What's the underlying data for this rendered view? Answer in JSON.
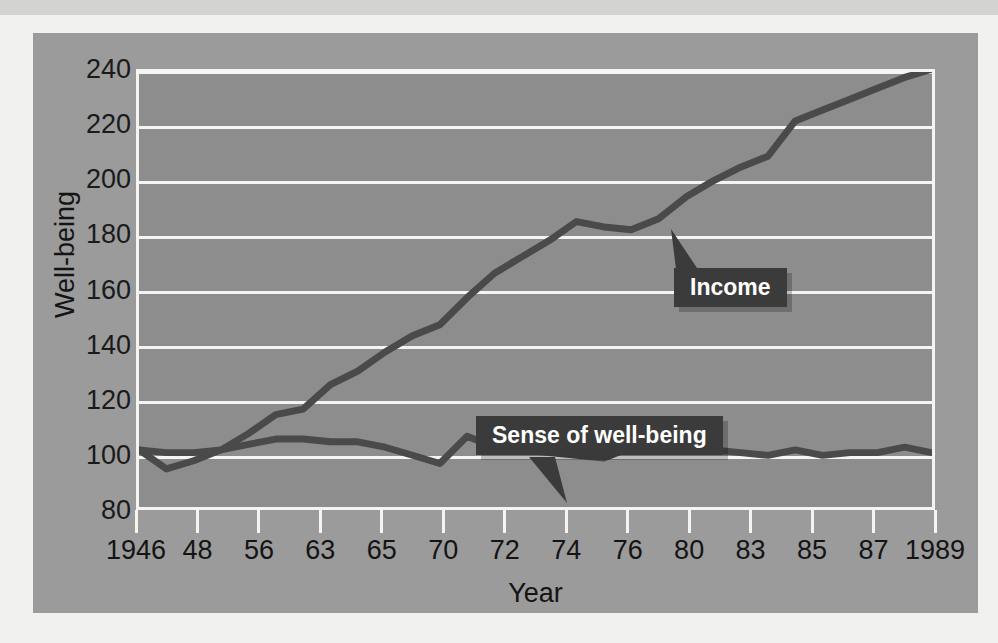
{
  "chart_data": {
    "type": "line",
    "title": "",
    "xlabel": "Year",
    "ylabel": "Well-being",
    "grid": true,
    "legend_position": "inline-callouts",
    "ylim": [
      80,
      240
    ],
    "yticks": [
      240,
      220,
      200,
      180,
      160,
      140,
      120,
      100,
      80
    ],
    "xtick_labels": [
      "1946",
      "48",
      "56",
      "63",
      "65",
      "70",
      "72",
      "74",
      "76",
      "80",
      "83",
      "85",
      "87",
      "1989"
    ],
    "x": [
      "1946",
      "1947",
      "1948",
      "1950",
      "1952",
      "1956",
      "1958",
      "1960",
      "1963",
      "1964",
      "1965",
      "1967",
      "1968",
      "1970",
      "1971",
      "1972",
      "1973",
      "1974",
      "1975",
      "1976",
      "1978",
      "1980",
      "1982",
      "1983",
      "1984",
      "1985",
      "1986",
      "1987",
      "1988",
      "1989"
    ],
    "series": [
      {
        "name": "Income",
        "color": "#4a4a4a",
        "values": [
          101,
          94,
          97,
          101,
          107,
          114,
          116,
          125,
          130,
          137,
          143,
          147,
          157,
          166,
          172,
          178,
          185,
          183,
          182,
          186,
          194,
          200,
          205,
          209,
          222,
          226,
          230,
          234,
          238,
          241
        ]
      },
      {
        "name": "Sense of well-being",
        "color": "#4a4a4a",
        "values": [
          101,
          100,
          100,
          101,
          103,
          105,
          105,
          104,
          104,
          102,
          99,
          96,
          106,
          102,
          101,
          100,
          99,
          98,
          102,
          101,
          101,
          101,
          100,
          99,
          101,
          99,
          100,
          100,
          102,
          100
        ]
      }
    ],
    "annotations": [
      {
        "name": "income-callout",
        "text": "Income",
        "points_to_series": "Income"
      },
      {
        "name": "wellbeing-callout",
        "text": "Sense of well-being",
        "points_to_series": "Sense of well-being"
      }
    ]
  },
  "axis": {
    "y_title": "Well-being",
    "x_title": "Year",
    "y_ticks": [
      "240",
      "220",
      "200",
      "180",
      "160",
      "140",
      "120",
      "100",
      "80"
    ],
    "x_ticks": [
      "1946",
      "48",
      "56",
      "63",
      "65",
      "70",
      "72",
      "74",
      "76",
      "80",
      "83",
      "85",
      "87",
      "1989"
    ]
  },
  "labels": {
    "income": "Income",
    "wellbeing": "Sense of well-being"
  },
  "colors": {
    "page_background": "#e9e9e7",
    "card_background": "#9b9b9b",
    "plot_background": "#8d8d8d",
    "gridline": "#f4f4f2",
    "series_line": "#4a4a4a",
    "callout_background": "#3b3b3b",
    "callout_text": "#ffffff",
    "tick_text": "#141414"
  }
}
